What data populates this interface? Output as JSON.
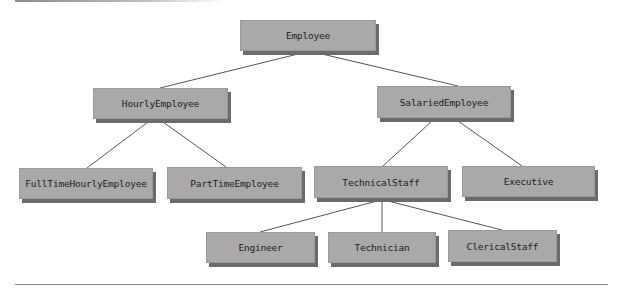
{
  "diagram": {
    "type": "class-hierarchy",
    "nodes": [
      {
        "id": "employee",
        "label": "Employee",
        "x": 240,
        "y": 20,
        "w": 136,
        "h": 31
      },
      {
        "id": "hourly",
        "label": "HourlyEmployee",
        "x": 93,
        "y": 88,
        "w": 135,
        "h": 31
      },
      {
        "id": "salaried",
        "label": "SalariedEmployee",
        "x": 377,
        "y": 86,
        "w": 134,
        "h": 32
      },
      {
        "id": "fulltime",
        "label": "FullTimeHourlyEmployee",
        "x": 19,
        "y": 168,
        "w": 134,
        "h": 31
      },
      {
        "id": "parttime",
        "label": "PartTimeEmployee",
        "x": 167,
        "y": 167,
        "w": 135,
        "h": 32
      },
      {
        "id": "technical",
        "label": "TechnicalStaff",
        "x": 314,
        "y": 166,
        "w": 134,
        "h": 32
      },
      {
        "id": "executive",
        "label": "Executive",
        "x": 462,
        "y": 166,
        "w": 133,
        "h": 31
      },
      {
        "id": "engineer",
        "label": "Engineer",
        "x": 206,
        "y": 232,
        "w": 109,
        "h": 31
      },
      {
        "id": "technician",
        "label": "Technician",
        "x": 328,
        "y": 232,
        "w": 108,
        "h": 31
      },
      {
        "id": "clerical",
        "label": "ClericalStaff",
        "x": 448,
        "y": 230,
        "w": 109,
        "h": 32
      }
    ],
    "edges": [
      {
        "from": "employee",
        "to": "hourly",
        "x1": 298,
        "y1": 54,
        "x2": 160,
        "y2": 88
      },
      {
        "from": "employee",
        "to": "salaried",
        "x1": 322,
        "y1": 54,
        "x2": 458,
        "y2": 86
      },
      {
        "from": "hourly",
        "to": "fulltime",
        "x1": 148,
        "y1": 122,
        "x2": 87,
        "y2": 168
      },
      {
        "from": "hourly",
        "to": "parttime",
        "x1": 163,
        "y1": 122,
        "x2": 226,
        "y2": 167
      },
      {
        "from": "salaried",
        "to": "technical",
        "x1": 432,
        "y1": 121,
        "x2": 383,
        "y2": 166
      },
      {
        "from": "salaried",
        "to": "executive",
        "x1": 458,
        "y1": 121,
        "x2": 522,
        "y2": 166
      },
      {
        "from": "technical",
        "to": "engineer",
        "x1": 377,
        "y1": 201,
        "x2": 260,
        "y2": 232
      },
      {
        "from": "technical",
        "to": "technician",
        "x1": 382,
        "y1": 201,
        "x2": 382,
        "y2": 232
      },
      {
        "from": "technical",
        "to": "clerical",
        "x1": 388,
        "y1": 201,
        "x2": 502,
        "y2": 230
      }
    ],
    "colors": {
      "node_fill": "#a9a9a9",
      "node_shadow": "#6b6b6b",
      "edge": "#555555",
      "text": "#1e1e1e"
    }
  }
}
